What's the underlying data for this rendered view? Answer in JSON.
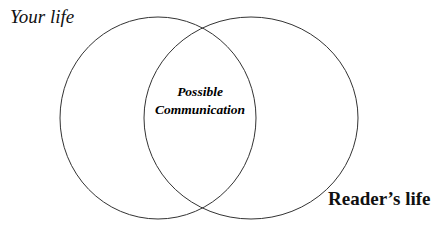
{
  "diagram": {
    "type": "venn",
    "circles": [
      {
        "label": "Your life",
        "stroke": "#333333"
      },
      {
        "label": "Reader’s life",
        "stroke": "#333333"
      }
    ],
    "overlap": {
      "line1": "Possible",
      "line2": "Communication"
    }
  }
}
